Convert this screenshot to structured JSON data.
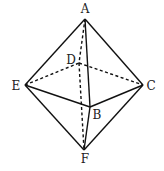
{
  "diagram": {
    "stroke_color": "#111111",
    "vertices": {
      "A": {
        "label": "A",
        "x": 85,
        "y": 19,
        "lx": 85,
        "ly": 13
      },
      "B": {
        "label": "B",
        "x": 90,
        "y": 107,
        "lx": 97,
        "ly": 119
      },
      "C": {
        "label": "C",
        "x": 143,
        "y": 85,
        "lx": 151,
        "ly": 90
      },
      "D": {
        "label": "D",
        "x": 79,
        "y": 63,
        "lx": 71,
        "ly": 64
      },
      "E": {
        "label": "E",
        "x": 25,
        "y": 85,
        "lx": 16,
        "ly": 90
      },
      "F": {
        "label": "F",
        "x": 84,
        "y": 150,
        "lx": 85,
        "ly": 163
      }
    },
    "solid_edges": [
      [
        "A",
        "E"
      ],
      [
        "A",
        "C"
      ],
      [
        "A",
        "B"
      ],
      [
        "E",
        "B"
      ],
      [
        "B",
        "C"
      ],
      [
        "E",
        "F"
      ],
      [
        "C",
        "F"
      ],
      [
        "B",
        "F"
      ]
    ],
    "dashed_edges": [
      [
        "A",
        "D"
      ],
      [
        "D",
        "F"
      ],
      [
        "E",
        "D"
      ],
      [
        "D",
        "C"
      ]
    ]
  }
}
